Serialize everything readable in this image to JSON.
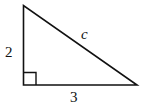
{
  "diagram": {
    "type": "right-triangle",
    "labels": {
      "vertical_leg": "2",
      "horizontal_leg": "3",
      "hypotenuse": "c"
    },
    "right_angle_marker": true
  }
}
